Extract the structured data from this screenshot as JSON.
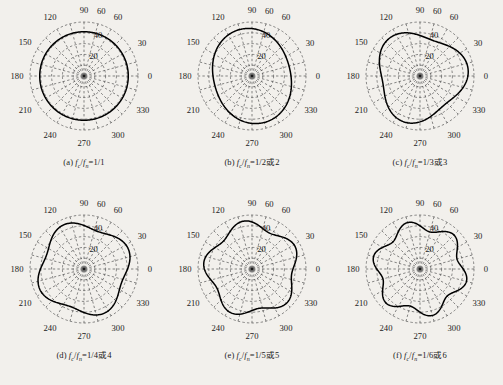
{
  "figure": {
    "background_color": "#f2f0ec",
    "curve_color": "#000000",
    "grid_color": "#555555",
    "panel_count": 6
  },
  "chart_data": [
    {
      "type": "line",
      "subtype": "polar",
      "panel": "a",
      "title": "",
      "caption": "(a) fc/fn=1/1",
      "caption_parts": {
        "index": "(a)",
        "num": "f",
        "num_sub": "c",
        "den": "f",
        "den_sub": "n",
        "value": "=1/1"
      },
      "lobes": 1,
      "theta_labels": [
        "0",
        "30",
        "60",
        "60",
        "90",
        "120",
        "150",
        "180",
        "210",
        "240",
        "270",
        "300",
        "330"
      ],
      "theta_ticks": [
        0,
        30,
        60,
        75,
        90,
        120,
        150,
        180,
        210,
        240,
        270,
        300,
        330
      ],
      "r_labels": [
        "20",
        "40"
      ],
      "r_ticks": [
        10,
        20,
        30,
        40,
        50
      ],
      "rlim": [
        0,
        50
      ],
      "r_outer": 50,
      "grid": true,
      "legend": "none",
      "r_mean": 41,
      "r_amp": 0.0,
      "phase_deg": 90,
      "xlabel": "",
      "ylabel": ""
    },
    {
      "type": "line",
      "subtype": "polar",
      "panel": "b",
      "title": "",
      "caption": "(b) fc/fn=1/2或2",
      "caption_parts": {
        "index": "(b)",
        "num": "f",
        "num_sub": "c",
        "den": "f",
        "den_sub": "n",
        "value": "=1/2或2"
      },
      "lobes": 2,
      "theta_labels": [
        "0",
        "30",
        "60",
        "60",
        "90",
        "120",
        "150",
        "180",
        "210",
        "240",
        "270",
        "300",
        "330"
      ],
      "theta_ticks": [
        0,
        30,
        60,
        75,
        90,
        120,
        150,
        180,
        210,
        240,
        270,
        300,
        330
      ],
      "r_labels": [
        "20",
        "40"
      ],
      "r_ticks": [
        10,
        20,
        30,
        40,
        50
      ],
      "rlim": [
        0,
        50
      ],
      "r_outer": 50,
      "grid": true,
      "legend": "none",
      "r_mean": 40,
      "r_amp": 4.5,
      "phase_deg": 105,
      "xlabel": "",
      "ylabel": ""
    },
    {
      "type": "line",
      "subtype": "polar",
      "panel": "c",
      "title": "",
      "caption": "(c) fc/fn=1/3或3",
      "caption_parts": {
        "index": "(c)",
        "num": "f",
        "num_sub": "c",
        "den": "f",
        "den_sub": "n",
        "value": "=1/3或3"
      },
      "lobes": 3,
      "theta_labels": [
        "0",
        "30",
        "60",
        "60",
        "90",
        "120",
        "150",
        "180",
        "210",
        "240",
        "270",
        "300",
        "330"
      ],
      "theta_ticks": [
        0,
        30,
        60,
        75,
        90,
        120,
        150,
        180,
        210,
        240,
        270,
        300,
        330
      ],
      "r_labels": [
        "20",
        "40"
      ],
      "r_ticks": [
        10,
        20,
        30,
        40,
        50
      ],
      "rlim": [
        0,
        50
      ],
      "r_outer": 50,
      "grid": true,
      "legend": "none",
      "r_mean": 40,
      "r_amp": 5.0,
      "phase_deg": 130,
      "xlabel": "",
      "ylabel": ""
    },
    {
      "type": "line",
      "subtype": "polar",
      "panel": "d",
      "title": "",
      "caption": "(d) fc/fn=1/4或4",
      "caption_parts": {
        "index": "(d)",
        "num": "f",
        "num_sub": "c",
        "den": "f",
        "den_sub": "n",
        "value": "=1/4或4"
      },
      "lobes": 4,
      "theta_labels": [
        "0",
        "30",
        "60",
        "60",
        "90",
        "120",
        "150",
        "180",
        "210",
        "240",
        "270",
        "300",
        "330"
      ],
      "theta_ticks": [
        0,
        30,
        60,
        75,
        90,
        120,
        150,
        180,
        210,
        240,
        270,
        300,
        330
      ],
      "r_labels": [
        "20",
        "40"
      ],
      "r_ticks": [
        10,
        20,
        30,
        40,
        50
      ],
      "rlim": [
        0,
        50
      ],
      "r_outer": 50,
      "grid": true,
      "legend": "none",
      "r_mean": 41,
      "r_amp": 4.0,
      "phase_deg": 115,
      "xlabel": "",
      "ylabel": ""
    },
    {
      "type": "line",
      "subtype": "polar",
      "panel": "e",
      "title": "",
      "caption": "(e) fc/fn=1/5或5",
      "caption_parts": {
        "index": "(e)",
        "num": "f",
        "num_sub": "c",
        "den": "f",
        "den_sub": "n",
        "value": "=1/5或5"
      },
      "lobes": 5,
      "theta_labels": [
        "0",
        "30",
        "60",
        "60",
        "90",
        "120",
        "150",
        "180",
        "210",
        "240",
        "270",
        "300",
        "330"
      ],
      "theta_ticks": [
        0,
        30,
        60,
        75,
        90,
        120,
        150,
        180,
        210,
        240,
        270,
        300,
        330
      ],
      "r_labels": [
        "20",
        "40"
      ],
      "r_ticks": [
        10,
        20,
        30,
        40,
        50
      ],
      "rlim": [
        0,
        50
      ],
      "r_outer": 50,
      "grid": true,
      "legend": "none",
      "r_mean": 41,
      "r_amp": 4.0,
      "phase_deg": 100,
      "xlabel": "",
      "ylabel": ""
    },
    {
      "type": "line",
      "subtype": "polar",
      "panel": "f",
      "title": "",
      "caption": "(f) fc/fn=1/6或6",
      "caption_parts": {
        "index": "(f)",
        "num": "f",
        "num_sub": "c",
        "den": "f",
        "den_sub": "n",
        "value": "=1/6或6"
      },
      "lobes": 6,
      "theta_labels": [
        "0",
        "30",
        "60",
        "60",
        "90",
        "120",
        "150",
        "180",
        "210",
        "240",
        "270",
        "300",
        "330"
      ],
      "theta_ticks": [
        0,
        30,
        60,
        75,
        90,
        120,
        150,
        180,
        210,
        240,
        270,
        300,
        330
      ],
      "r_labels": [
        "20",
        "40"
      ],
      "r_ticks": [
        10,
        20,
        30,
        40,
        50
      ],
      "rlim": [
        0,
        50
      ],
      "r_outer": 50,
      "grid": true,
      "legend": "none",
      "r_mean": 40,
      "r_amp": 4.5,
      "phase_deg": 105,
      "xlabel": "",
      "ylabel": ""
    }
  ]
}
